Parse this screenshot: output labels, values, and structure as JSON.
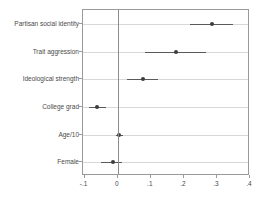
{
  "chart_data": {
    "type": "scatter",
    "title": "",
    "subtitle": "",
    "xlabel": "",
    "ylabel": "",
    "xlim": [
      -0.105,
      0.4
    ],
    "ylim": [
      0,
      6
    ],
    "grid": true,
    "legend": null,
    "orientation": "horizontal",
    "plot_style": "coefficient-plot-with-confidence-intervals",
    "reference_line": 0,
    "xticks": [
      -0.1,
      0,
      0.1,
      0.2,
      0.3,
      0.4
    ],
    "xticklabels": [
      "-.1",
      "0",
      ".1",
      ".2",
      ".3",
      ".4"
    ],
    "categories": [
      "Partisan social identity",
      "Trait aggression",
      "Ideological strength",
      "College grad",
      "Age/10",
      "Female"
    ],
    "values": [
      0.285,
      0.175,
      0.075,
      -0.062,
      0.005,
      -0.015
    ],
    "ci_low": [
      0.22,
      0.082,
      0.028,
      -0.088,
      -0.006,
      -0.052
    ],
    "ci_high": [
      0.35,
      0.268,
      0.123,
      -0.034,
      0.016,
      0.014
    ],
    "points": [
      {
        "label": "Partisan social identity",
        "estimate": 0.285,
        "ci_low": 0.22,
        "ci_high": 0.35
      },
      {
        "label": "Trait aggression",
        "estimate": 0.175,
        "ci_low": 0.082,
        "ci_high": 0.268
      },
      {
        "label": "Ideological strength",
        "estimate": 0.075,
        "ci_low": 0.028,
        "ci_high": 0.123
      },
      {
        "label": "College grad",
        "estimate": -0.062,
        "ci_low": -0.088,
        "ci_high": -0.034
      },
      {
        "label": "Age/10",
        "estimate": 0.005,
        "ci_low": -0.006,
        "ci_high": 0.016
      },
      {
        "label": "Female",
        "estimate": -0.015,
        "ci_low": -0.052,
        "ci_high": 0.014
      }
    ]
  },
  "colors": {
    "marker": "#3d3d3d",
    "ci": "#5a5a5a",
    "frame": "#9a9a9a",
    "grid": "#d8d8d8",
    "zero_line": "#8c8c8c",
    "text": "#4a4a4a",
    "background": "#ffffff"
  }
}
